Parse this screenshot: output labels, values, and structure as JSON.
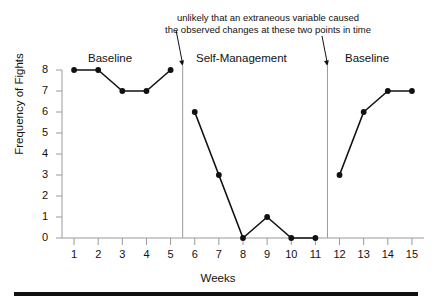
{
  "annotation": {
    "line1": "unlikely that an extraneous variable caused",
    "line2": "the observed changes at these two points in time"
  },
  "phases": [
    {
      "label": "Baseline"
    },
    {
      "label": "Self-Management"
    },
    {
      "label": "Baseline"
    }
  ],
  "axes": {
    "xlabel": "Weeks",
    "ylabel": "Frequency of Fights"
  },
  "colors": {
    "line": "#111111",
    "marker": "#111111",
    "axis": "#9a9a9a",
    "divider": "#9a9a9a",
    "rule": "#111111",
    "background": "#ffffff"
  },
  "chart_data": {
    "type": "line",
    "title": "",
    "xlabel": "Weeks",
    "ylabel": "Frequency of Fights",
    "x": [
      1,
      2,
      3,
      4,
      5,
      6,
      7,
      8,
      9,
      10,
      11,
      12,
      13,
      14,
      15
    ],
    "xtick_labels": [
      "1",
      "2",
      "3",
      "4",
      "5",
      "6",
      "7",
      "8",
      "9",
      "10",
      "11",
      "12",
      "13",
      "14",
      "15"
    ],
    "ytick_labels": [
      "0",
      "1",
      "2",
      "3",
      "4",
      "5",
      "6",
      "7",
      "8"
    ],
    "xlim": [
      0.5,
      15.5
    ],
    "ylim": [
      0,
      8
    ],
    "grid": false,
    "legend": false,
    "series": [
      {
        "name": "Frequency of Fights",
        "values": [
          8,
          8,
          7,
          7,
          8,
          6,
          3,
          0,
          1,
          0,
          0,
          3,
          6,
          7,
          7
        ],
        "segments": [
          {
            "phase": "Baseline",
            "x": [
              1,
              2,
              3,
              4,
              5
            ],
            "values": [
              8,
              8,
              7,
              7,
              8
            ]
          },
          {
            "phase": "Self-Management",
            "x": [
              6,
              7,
              8,
              9,
              10,
              11
            ],
            "values": [
              6,
              3,
              0,
              1,
              0,
              0
            ]
          },
          {
            "phase": "Baseline",
            "x": [
              12,
              13,
              14,
              15
            ],
            "values": [
              3,
              6,
              7,
              7
            ]
          }
        ]
      }
    ],
    "phase_dividers": [
      5.5,
      11.5
    ],
    "annotations": [
      {
        "text": "unlikely that an extraneous variable caused the observed changes at these two points in time",
        "points_to": [
          5.5,
          11.5
        ]
      }
    ]
  }
}
